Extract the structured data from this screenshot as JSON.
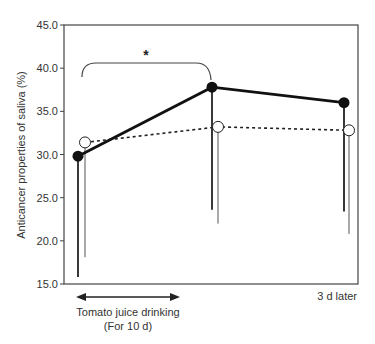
{
  "chart_data": {
    "type": "line",
    "title": "",
    "xlabel": "",
    "ylabel": "Anticancer properties of saliva (%)",
    "ylim": [
      15.0,
      45.0
    ],
    "yticks": [
      "15.0",
      "20.0",
      "25.0",
      "30.0",
      "35.0",
      "40.0",
      "45.0"
    ],
    "x": [
      "Before",
      "After 10 d",
      "3 d later"
    ],
    "grid": false,
    "series": [
      {
        "name": "Tomato juice group (filled)",
        "style": "solid",
        "marker": "filled-circle",
        "values": [
          29.8,
          37.8,
          36.0
        ],
        "error_lower": [
          15.8,
          23.6,
          23.4
        ]
      },
      {
        "name": "Control group (open)",
        "style": "dashed",
        "marker": "open-circle",
        "values": [
          31.4,
          33.2,
          32.8
        ],
        "error_lower": [
          18.1,
          22.0,
          20.8
        ]
      }
    ],
    "annotations": [
      {
        "type": "significance-bracket",
        "from": 0,
        "to": 1,
        "label": "*"
      },
      {
        "type": "period-arrow",
        "label_line1": "Tomato juice drinking",
        "label_line2": "(For 10 d)"
      },
      {
        "type": "x-label",
        "label": "3 d later"
      }
    ]
  },
  "labels": {
    "ylabel": "Anticancer properties of saliva (%)",
    "star": "*",
    "arrow_line1": "Tomato juice drinking",
    "arrow_line2": "(For 10 d)",
    "later": "3 d later"
  }
}
